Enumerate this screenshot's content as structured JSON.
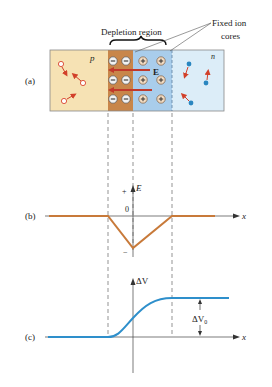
{
  "figure": {
    "panel_a": {
      "label": "(a)",
      "title_depletion": "Depletion region",
      "title_fixed_line1": "Fixed ion",
      "title_fixed_line2": "cores",
      "p_label": "p",
      "n_label": "n",
      "field_label": "E",
      "negative_ion_symbol": "−",
      "positive_ion_symbol": "+"
    },
    "panel_b": {
      "label": "(b)",
      "y_axis_label": "E",
      "plus_mark": "+",
      "minus_mark": "−",
      "zero_label": "0",
      "x_axis_label": "x"
    },
    "panel_c": {
      "label": "(c)",
      "y_axis_label": "ΔV",
      "delta_label": "ΔV",
      "delta_sub": "0",
      "x_axis_label": "x"
    }
  },
  "colors": {
    "p_region": "#F6E2B4",
    "depletion_negative": "#C8864A",
    "depletion_positive": "#A9CDEB",
    "n_region": "#DCEDF8",
    "field_arrow": "#C0392B",
    "electric_field_curve": "#C87A3A",
    "potential_curve": "#2E8FCB",
    "hole": "#D9442E",
    "electron": "#2A86C0"
  }
}
